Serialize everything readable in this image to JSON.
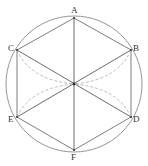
{
  "diagram": {
    "colors": {
      "circle": "#8a8a8a",
      "edges": "#6f6f6f",
      "diagonals": "#5a5a5a",
      "dashed": "#a8a8a8",
      "center_dot": "#333333",
      "label": "#333333"
    },
    "center": {
      "x": 74,
      "y": 84
    },
    "circle_radius": 68,
    "vertices": [
      {
        "id": "A",
        "label": "A",
        "x": 74,
        "y": 18,
        "label_x": 71,
        "label_y": 13
      },
      {
        "id": "B",
        "label": "B",
        "x": 131,
        "y": 50,
        "label_x": 133,
        "label_y": 51
      },
      {
        "id": "C",
        "label": "C",
        "x": 17,
        "y": 50,
        "label_x": 8,
        "label_y": 51
      },
      {
        "id": "D",
        "label": "D",
        "x": 131,
        "y": 117,
        "label_x": 133,
        "label_y": 122
      },
      {
        "id": "E",
        "label": "E",
        "x": 17,
        "y": 117,
        "label_x": 8,
        "label_y": 122
      },
      {
        "id": "F",
        "label": "F",
        "x": 74,
        "y": 150,
        "label_x": 71,
        "label_y": 160
      }
    ],
    "hexagon_edges": [
      [
        "A",
        "B"
      ],
      [
        "B",
        "D"
      ],
      [
        "D",
        "F"
      ],
      [
        "F",
        "E"
      ],
      [
        "E",
        "C"
      ],
      [
        "C",
        "A"
      ]
    ],
    "diagonals": [
      [
        "A",
        "F"
      ],
      [
        "C",
        "D"
      ],
      [
        "B",
        "E"
      ]
    ],
    "dashed_arcs": [
      {
        "from": "C",
        "to": "O"
      },
      {
        "from": "E",
        "to": "O"
      },
      {
        "from": "B",
        "to": "O"
      },
      {
        "from": "D",
        "to": "O"
      }
    ],
    "caption": ""
  }
}
